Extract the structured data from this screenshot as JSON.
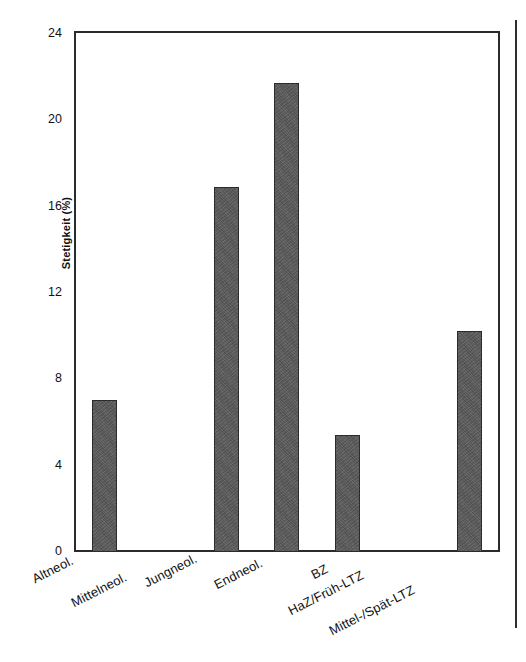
{
  "figure": {
    "background_color": "#ffffff",
    "frame_color": "#2b2b2b",
    "bar_color": "#5b5b5b"
  },
  "chart_data": {
    "type": "bar",
    "title": "",
    "subtitle": "",
    "xlabel": "",
    "ylabel": "Stetigkeit (%)",
    "ylim": [
      0,
      24
    ],
    "ytick_labels": [
      "0",
      "4",
      "8",
      "12",
      "16",
      "20",
      "24"
    ],
    "ytick_values": [
      0,
      4,
      8,
      12,
      16,
      20,
      24
    ],
    "grid": false,
    "legend": false,
    "legend_position": "none",
    "categories": [
      "Altneol.",
      "Mittelneol.",
      "Jungneol.",
      "Endneol.",
      "BZ",
      "HaZ/Früh-LTZ",
      "Mittel-/Spät-LTZ"
    ],
    "values": [
      7.0,
      0,
      16.8,
      21.6,
      5.4,
      0,
      10.2
    ]
  }
}
